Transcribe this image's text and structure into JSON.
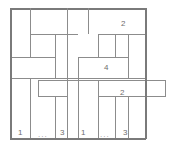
{
  "figure": {
    "name": "brick-tiling-diagram",
    "width": 171,
    "height": 148,
    "background_color": "#ffffff",
    "line_color": "#8c8c8c",
    "border_color": "#7a7a7a",
    "label_color": "#6e6e6e",
    "outer_border": {
      "x": 10,
      "y": 8,
      "width": 136,
      "height": 131
    },
    "labels": [
      {
        "id": "label-top-right-2",
        "text": "2",
        "x": 121,
        "y": 20
      },
      {
        "id": "label-middle-4",
        "text": "4",
        "x": 104,
        "y": 64
      },
      {
        "id": "label-right-band-2",
        "text": "2",
        "x": 120,
        "y": 89
      },
      {
        "id": "label-bottom-1-left",
        "text": "1",
        "x": 18,
        "y": 129
      },
      {
        "id": "label-bottom-3-left",
        "text": "3",
        "x": 60,
        "y": 129
      },
      {
        "id": "label-bottom-1-mid",
        "text": "1",
        "x": 81,
        "y": 129
      },
      {
        "id": "label-bottom-3-right",
        "text": "3",
        "x": 123,
        "y": 129
      }
    ],
    "ellipses": [
      {
        "id": "ellipsis-left",
        "text": "...",
        "x": 38,
        "y": 131
      },
      {
        "id": "ellipsis-right",
        "text": "...",
        "x": 100,
        "y": 131
      }
    ],
    "horizontal_lines": [
      {
        "id": "h-border-top",
        "x": 10,
        "y": 8,
        "length": 136,
        "thick": true
      },
      {
        "id": "h-row1-left",
        "x": 30,
        "y": 34,
        "length": 48,
        "thick": false
      },
      {
        "id": "h-row1-right",
        "x": 98,
        "y": 34,
        "length": 48,
        "thick": false
      },
      {
        "id": "h-row2-left",
        "x": 10,
        "y": 57,
        "length": 45,
        "thick": false
      },
      {
        "id": "h-row2-right",
        "x": 78,
        "y": 57,
        "length": 50,
        "thick": false
      },
      {
        "id": "h-row3-full",
        "x": 10,
        "y": 78,
        "length": 136,
        "thick": false
      },
      {
        "id": "h-band-top",
        "x": 38,
        "y": 80,
        "length": 128,
        "thick": false
      },
      {
        "id": "h-band-left-bot",
        "x": 38,
        "y": 96,
        "length": 30,
        "thick": false
      },
      {
        "id": "h-band-right-bot",
        "x": 98,
        "y": 96,
        "length": 68,
        "thick": false
      },
      {
        "id": "h-border-bottom",
        "x": 10,
        "y": 138,
        "length": 136,
        "thick": true
      }
    ],
    "vertical_lines": [
      {
        "id": "v-border-left",
        "x": 10,
        "y": 8,
        "length": 131,
        "thick": true
      },
      {
        "id": "v-top-a",
        "x": 30,
        "y": 8,
        "length": 26,
        "thick": false
      },
      {
        "id": "v-top-b",
        "x": 67,
        "y": 8,
        "length": 70,
        "thick": false
      },
      {
        "id": "v-top-c",
        "x": 88,
        "y": 8,
        "length": 26,
        "thick": false
      },
      {
        "id": "v-mid-a",
        "x": 30,
        "y": 34,
        "length": 23,
        "thick": false
      },
      {
        "id": "v-mid-b",
        "x": 55,
        "y": 34,
        "length": 44,
        "thick": false
      },
      {
        "id": "v-mid-c",
        "x": 98,
        "y": 34,
        "length": 23,
        "thick": false
      },
      {
        "id": "v-mid-d",
        "x": 115,
        "y": 34,
        "length": 23,
        "thick": false
      },
      {
        "id": "v-mid-e",
        "x": 128,
        "y": 34,
        "length": 44,
        "thick": false
      },
      {
        "id": "v-mid-f",
        "x": 78,
        "y": 57,
        "length": 21,
        "thick": false
      },
      {
        "id": "v-bot-a",
        "x": 30,
        "y": 78,
        "length": 60,
        "thick": false
      },
      {
        "id": "v-bot-b",
        "x": 38,
        "y": 80,
        "length": 16,
        "thick": false
      },
      {
        "id": "v-bot-c",
        "x": 55,
        "y": 96,
        "length": 42,
        "thick": false
      },
      {
        "id": "v-bot-d",
        "x": 67,
        "y": 78,
        "length": 60,
        "thick": false
      },
      {
        "id": "v-bot-e",
        "x": 78,
        "y": 78,
        "length": 60,
        "thick": false
      },
      {
        "id": "v-bot-f",
        "x": 98,
        "y": 80,
        "length": 58,
        "thick": false
      },
      {
        "id": "v-bot-g",
        "x": 115,
        "y": 96,
        "length": 42,
        "thick": false
      },
      {
        "id": "v-bot-h",
        "x": 128,
        "y": 96,
        "length": 42,
        "thick": false
      },
      {
        "id": "v-band-right",
        "x": 165,
        "y": 80,
        "length": 16,
        "thick": false
      },
      {
        "id": "v-border-right",
        "x": 145,
        "y": 8,
        "length": 131,
        "thick": true
      }
    ]
  }
}
